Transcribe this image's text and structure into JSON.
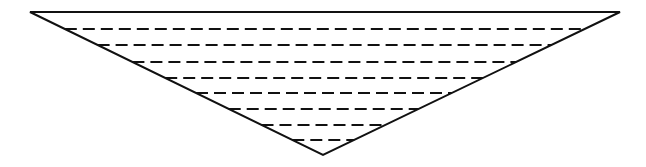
{
  "diagram": {
    "type": "inverted-triangle-with-horizontal-dashed-levels",
    "colors": {
      "background": "#ffffff",
      "stroke": "#111111"
    },
    "triangle": {
      "top_left": [
        30,
        12
      ],
      "top_right": [
        620,
        12
      ],
      "apex": [
        323,
        155
      ]
    },
    "dashed_levels": [
      {
        "y": 29
      },
      {
        "y": 45
      },
      {
        "y": 62
      },
      {
        "y": 78
      },
      {
        "y": 93
      },
      {
        "y": 109
      },
      {
        "y": 125
      },
      {
        "y": 140
      }
    ],
    "dash_pattern": "12 6"
  }
}
